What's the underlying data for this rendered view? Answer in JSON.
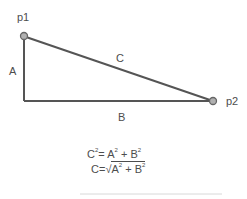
{
  "diagram": {
    "type": "right-triangle",
    "points": [
      {
        "label": "p1",
        "x": 24,
        "y": 36
      },
      {
        "label": "p2",
        "x": 213,
        "y": 101
      }
    ],
    "sides": {
      "vertical": "A",
      "horizontal": "B",
      "hypotenuse": "C"
    },
    "formulas": {
      "line1": {
        "c": "C",
        "eq": "= ",
        "a": "A",
        "plus": " + ",
        "b": "B",
        "exp": "2"
      },
      "line2": {
        "c": "C",
        "eq": "=",
        "radical": "√",
        "a": "A",
        "plus": " + ",
        "b": "B",
        "exp": "2"
      }
    },
    "colors": {
      "line": "#555555",
      "point_fill": "#b0b0b0",
      "point_stroke": "#666666"
    }
  }
}
